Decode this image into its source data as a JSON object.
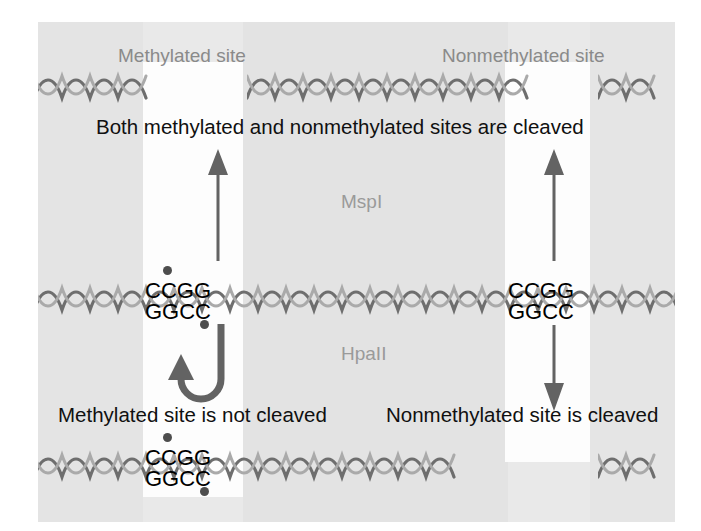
{
  "figure": {
    "background_color": "#e9e9e9",
    "page_color": "#ffffff",
    "ink_color": "#101010",
    "gray_label_color": "#8a8a8a",
    "helix_color": "#6e6e6e",
    "methyl_dot_color": "#4d4d4d"
  },
  "top_row": {
    "methylated_site_label": "Methylated site",
    "nonmethylated_site_label": "Nonmethylated site"
  },
  "statements": {
    "mspi_result": "Both methylated and nonmethylated sites are cleaved",
    "hpaii_methylated_result": "Methylated site is not cleaved",
    "hpaii_nonmethylated_result": "Nonmethylated site is cleaved"
  },
  "enzymes": {
    "upper": "MspI",
    "lower": "HpaII"
  },
  "sequences": {
    "middle_methylated": {
      "top_strand": "CCGG",
      "bottom_strand": "GGCC",
      "methylated": true
    },
    "middle_nonmethylated": {
      "top_strand": "CCGG",
      "bottom_strand": "GGCC",
      "methylated": false
    },
    "bottom_methylated": {
      "top_strand": "CCGG",
      "bottom_strand": "GGCC",
      "methylated": true
    }
  }
}
